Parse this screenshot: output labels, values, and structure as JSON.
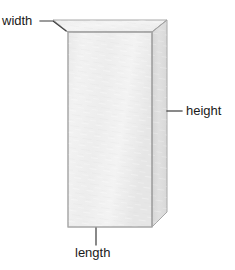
{
  "figure": {
    "type": "rectangular-prism-diagram",
    "title": "",
    "background_color": "#ffffff",
    "shape": {
      "name": "rectangular prism",
      "front_face_color": "#efefef",
      "top_face_color": "#f1f1f1",
      "right_face_color": "#dddddd",
      "edge_color": "#a8a8a8",
      "front_face": {
        "left": 68,
        "top": 32,
        "right": 152,
        "bottom": 227
      },
      "top_face": [
        [
          68,
          32
        ],
        [
          53,
          20
        ],
        [
          167,
          20
        ],
        [
          152,
          32
        ]
      ],
      "right_face": [
        [
          152,
          32
        ],
        [
          167,
          20
        ],
        [
          167,
          212
        ],
        [
          152,
          227
        ]
      ]
    },
    "leader_line_color": "#3a3a3a",
    "leader_lines": [
      {
        "name": "width-leader",
        "points": [
          [
            40,
            21
          ],
          [
            53,
            21
          ],
          [
            66,
            31
          ]
        ]
      },
      {
        "name": "height-leader",
        "points": [
          [
            167,
            111
          ],
          [
            182,
            111
          ]
        ]
      },
      {
        "name": "length-leader",
        "points": [
          [
            96,
            228
          ],
          [
            96,
            245
          ]
        ]
      }
    ],
    "labels": [
      {
        "id": "width",
        "text": "width",
        "position": "top-left"
      },
      {
        "id": "height",
        "text": "height",
        "position": "right-middle"
      },
      {
        "id": "length",
        "text": "length",
        "position": "bottom-center"
      }
    ]
  }
}
